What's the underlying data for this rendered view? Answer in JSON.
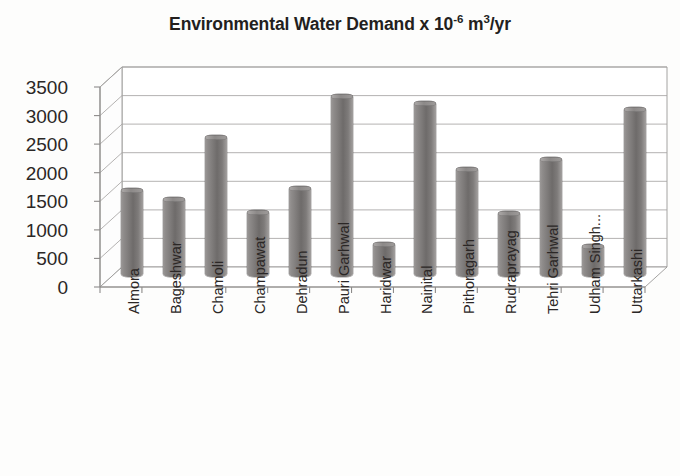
{
  "chart_data": {
    "type": "bar",
    "title": "Environmental Water Demand x 10-6 m3/yr",
    "title_main": "Environmental Water Demand x 10",
    "title_exp": "-6",
    "title_unit_m": " m",
    "title_unit_cube": "3",
    "title_unit_yr": "/yr",
    "xlabel": "",
    "ylabel": "",
    "ylim": [
      0,
      3500
    ],
    "ytick_step": 500,
    "yticks": [
      "0",
      "500",
      "1000",
      "1500",
      "2000",
      "2500",
      "3000",
      "3500"
    ],
    "grid": true,
    "legend": false,
    "legend_position": "none",
    "style": "3d-cylinder",
    "bar_color": "#7b7877",
    "plot_background": "#ffffff",
    "axis_color": "#808080",
    "text_color": "#2b2726",
    "categories": [
      "Almora",
      "Bageshwar",
      "Chamoli",
      "Champawat",
      "Dehradun",
      "Pauri Garhwal",
      "Haridwar",
      "Nainital",
      "Pithoragarh",
      "Rudraprayag",
      "Tehri Garhwal",
      "Udham Singh...",
      "Uttarkashi"
    ],
    "values": [
      1550,
      1400,
      2480,
      1180,
      1590,
      3200,
      620,
      3080,
      1930,
      1150,
      2100,
      580,
      2980
    ]
  }
}
